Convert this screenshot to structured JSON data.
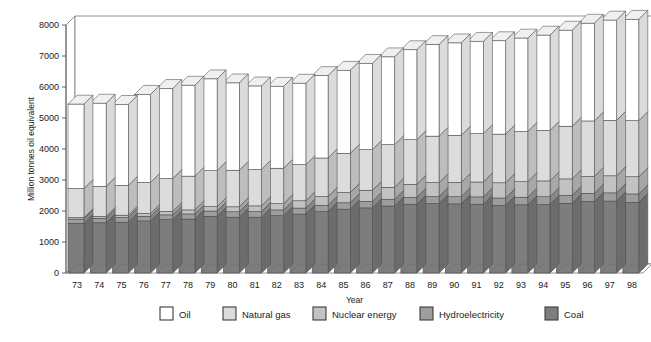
{
  "chart_data": {
    "type": "bar",
    "stacked": true,
    "title": "",
    "xlabel": "Year",
    "ylabel": "Million tonnes oil equivalent",
    "ylim": [
      0,
      8000
    ],
    "ytick_step": 1000,
    "yticks": [
      "0",
      "1000",
      "2000",
      "3000",
      "4000",
      "5000",
      "6000",
      "7000",
      "8000"
    ],
    "grid": false,
    "legend_position": "bottom",
    "categories": [
      "73",
      "74",
      "75",
      "76",
      "77",
      "78",
      "79",
      "80",
      "81",
      "82",
      "83",
      "84",
      "85",
      "86",
      "87",
      "88",
      "89",
      "90",
      "91",
      "92",
      "93",
      "94",
      "95",
      "96",
      "97",
      "98"
    ],
    "series": [
      {
        "name": "Coal",
        "color": "#7d7d7d",
        "values": [
          1600,
          1620,
          1640,
          1680,
          1720,
          1740,
          1830,
          1800,
          1800,
          1850,
          1900,
          1980,
          2060,
          2100,
          2160,
          2220,
          2240,
          2230,
          2220,
          2180,
          2200,
          2210,
          2250,
          2310,
          2320,
          2280
        ]
      },
      {
        "name": "Hydroelectricity",
        "color": "#9e9e9e",
        "values": [
          140,
          145,
          150,
          150,
          155,
          165,
          170,
          175,
          180,
          185,
          195,
          200,
          205,
          210,
          215,
          220,
          225,
          230,
          235,
          240,
          245,
          250,
          255,
          260,
          265,
          270
        ]
      },
      {
        "name": "Nuclear energy",
        "color": "#c2c2c2",
        "values": [
          45,
          60,
          75,
          90,
          110,
          130,
          140,
          160,
          185,
          200,
          235,
          285,
          330,
          360,
          390,
          420,
          450,
          460,
          480,
          490,
          500,
          510,
          530,
          545,
          550,
          555
        ]
      },
      {
        "name": "Natural gas",
        "color": "#dcdcdc",
        "values": [
          940,
          970,
          960,
          1000,
          1060,
          1090,
          1160,
          1180,
          1175,
          1145,
          1165,
          1245,
          1265,
          1310,
          1375,
          1440,
          1500,
          1520,
          1560,
          1570,
          1620,
          1630,
          1700,
          1790,
          1790,
          1810
        ]
      },
      {
        "name": "Oil",
        "color": "#ffffff",
        "values": [
          2720,
          2680,
          2610,
          2840,
          2905,
          2930,
          2960,
          2815,
          2690,
          2640,
          2625,
          2655,
          2675,
          2780,
          2830,
          2900,
          2950,
          2980,
          2975,
          3010,
          3010,
          3070,
          3095,
          3150,
          3230,
          3265
        ]
      }
    ],
    "legend": [
      {
        "label": "Oil",
        "color": "#ffffff"
      },
      {
        "label": "Natural gas",
        "color": "#dcdcdc"
      },
      {
        "label": "Nuclear energy",
        "color": "#c2c2c2"
      },
      {
        "label": "Hydroelectricity",
        "color": "#9e9e9e"
      },
      {
        "label": "Coal",
        "color": "#7d7d7d"
      }
    ]
  }
}
